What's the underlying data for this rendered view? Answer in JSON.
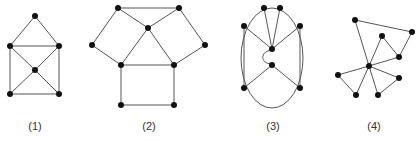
{
  "figure": {
    "graphs": [
      {
        "label": "(1)",
        "nodes": [
          [
            35,
            16
          ],
          [
            10,
            46
          ],
          [
            59,
            46
          ],
          [
            35,
            70
          ],
          [
            10,
            94
          ],
          [
            59,
            94
          ]
        ],
        "edges": [
          [
            0,
            1
          ],
          [
            0,
            2
          ],
          [
            1,
            2
          ],
          [
            1,
            3
          ],
          [
            2,
            3
          ],
          [
            1,
            4
          ],
          [
            2,
            5
          ],
          [
            3,
            4
          ],
          [
            3,
            5
          ],
          [
            4,
            5
          ]
        ],
        "label_pos": [
          35,
          130
        ]
      },
      {
        "label": "(2)",
        "nodes": [
          [
            118,
            8
          ],
          [
            179,
            8
          ],
          [
            148,
            28
          ],
          [
            92,
            45
          ],
          [
            121,
            65
          ],
          [
            174,
            65
          ],
          [
            205,
            45
          ],
          [
            121,
            105
          ],
          [
            174,
            105
          ]
        ],
        "edges": [
          [
            0,
            1
          ],
          [
            0,
            2
          ],
          [
            1,
            2
          ],
          [
            0,
            3
          ],
          [
            3,
            4
          ],
          [
            2,
            4
          ],
          [
            2,
            5
          ],
          [
            1,
            6
          ],
          [
            6,
            5
          ],
          [
            4,
            5
          ],
          [
            4,
            7
          ],
          [
            5,
            8
          ],
          [
            7,
            8
          ]
        ],
        "label_pos": [
          149,
          130
        ]
      },
      {
        "label": "(3)",
        "ellipse": {
          "cx": 272,
          "cy": 58,
          "rx": 31,
          "ry": 50
        },
        "nodes": [
          [
            264,
            8
          ],
          [
            280,
            8
          ],
          [
            244,
            26
          ],
          [
            300,
            26
          ],
          [
            272,
            49
          ],
          [
            272,
            65
          ],
          [
            244,
            88
          ],
          [
            300,
            88
          ]
        ],
        "edges": [
          [
            0,
            4
          ],
          [
            1,
            4
          ],
          [
            2,
            4
          ],
          [
            3,
            4
          ],
          [
            2,
            6
          ],
          [
            3,
            7
          ],
          [
            5,
            6
          ],
          [
            5,
            7
          ]
        ],
        "arc": "M 271 50 C 260 52 260 63 271 64",
        "label_pos": [
          273,
          130
        ]
      },
      {
        "label": "(4)",
        "nodes": [
          [
            355,
            20
          ],
          [
            412,
            32
          ],
          [
            382,
            36
          ],
          [
            399,
            57
          ],
          [
            369,
            66
          ],
          [
            338,
            75
          ],
          [
            399,
            78
          ],
          [
            356,
            95
          ],
          [
            378,
            95
          ]
        ],
        "edges": [
          [
            0,
            1
          ],
          [
            1,
            3
          ],
          [
            2,
            3
          ],
          [
            0,
            4
          ],
          [
            2,
            4
          ],
          [
            4,
            3
          ],
          [
            4,
            5
          ],
          [
            5,
            7
          ],
          [
            4,
            7
          ],
          [
            4,
            6
          ],
          [
            4,
            8
          ],
          [
            8,
            6
          ]
        ],
        "label_pos": [
          374,
          130
        ]
      }
    ]
  }
}
